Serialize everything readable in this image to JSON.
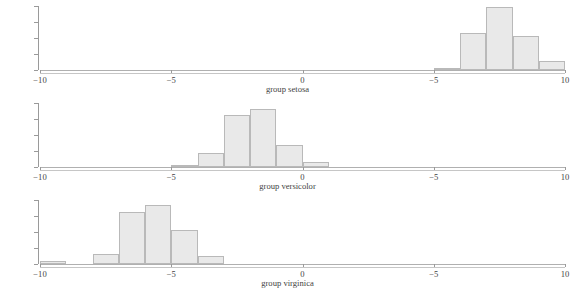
{
  "figure": {
    "background": "#ffffff",
    "bar_fill": "#e9e9e9",
    "bar_edge": "#b9b9b9",
    "axis_color": "#9a9a9a"
  },
  "axis": {
    "y_tick_labels": [
      "0.0",
      "0.1",
      "0.2",
      "0.3",
      "0.4"
    ],
    "y_range": [
      0.0,
      0.4
    ],
    "x_tick_labels": [
      "−10",
      "−5",
      "0",
      "−5",
      "10"
    ],
    "x_tick_values": [
      -10,
      -5,
      0,
      5,
      10
    ],
    "x_range": [
      -10,
      10
    ],
    "grid": false
  },
  "chart_data": [
    {
      "type": "bar",
      "title": "group setosa",
      "xlabel": "group setosa",
      "ylabel": "",
      "xlim": [
        -10,
        10
      ],
      "ylim": [
        0.0,
        0.4
      ],
      "bin_width": 1,
      "bin_edges": [
        4,
        5,
        6,
        7,
        8,
        9,
        10
      ],
      "bin_centers": [
        4.5,
        5.5,
        6.5,
        7.5,
        8.5,
        9.5
      ],
      "values": [
        0.0,
        0.012,
        0.222,
        0.384,
        0.205,
        0.052
      ],
      "legend": null
    },
    {
      "type": "bar",
      "title": "group versicolor",
      "xlabel": "group versicolor",
      "ylabel": "",
      "xlim": [
        -10,
        10
      ],
      "ylim": [
        0.0,
        0.4
      ],
      "bin_width": 1,
      "bin_edges": [
        -5,
        -4,
        -3,
        -2,
        -1,
        0,
        1,
        2
      ],
      "bin_centers": [
        -4.5,
        -3.5,
        -2.5,
        -1.5,
        -0.5,
        0.5,
        1.5
      ],
      "values": [
        0.014,
        0.086,
        0.318,
        0.352,
        0.132,
        0.028,
        0.0
      ],
      "legend": null
    },
    {
      "type": "bar",
      "title": "group virginica",
      "xlabel": "group virginica",
      "ylabel": "",
      "xlim": [
        -10,
        10
      ],
      "ylim": [
        0.0,
        0.4
      ],
      "bin_width": 1,
      "bin_edges": [
        -10,
        -9,
        -8,
        -7,
        -6,
        -5,
        -4,
        -3
      ],
      "bin_centers": [
        -9.5,
        -8.5,
        -7.5,
        -6.5,
        -5.5,
        -4.5,
        -3.5
      ],
      "values": [
        0.018,
        0.0,
        0.058,
        0.318,
        0.358,
        0.205,
        0.048
      ],
      "legend": null
    }
  ]
}
